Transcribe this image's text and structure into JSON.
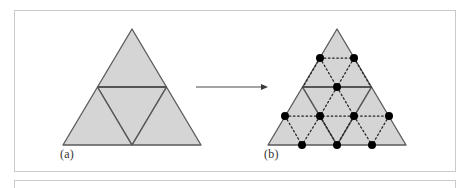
{
  "figure": {
    "captions": {
      "a": "(a)",
      "b": "(b)"
    },
    "arrow": {
      "name": "transform-arrow",
      "x1": 196,
      "y1": 87,
      "x2": 268,
      "y2": 87,
      "color": "#4a4a4a"
    },
    "colors": {
      "triangle_fill": "#d5d5d5",
      "triangle_stroke": "#5a5a5a",
      "dotted_stroke": "#2a2a2a",
      "dot_fill": "#000000",
      "panel_border": "#c9cbcd",
      "background": "#ffffff",
      "caption_text": "#333333"
    },
    "panel_a": {
      "name": "triangle-panel-a",
      "outer_triangle": [
        [
          132,
          29
        ],
        [
          63,
          145
        ],
        [
          201,
          145
        ]
      ],
      "midpoints": [
        [
          97.5,
          87
        ],
        [
          166.5,
          87
        ],
        [
          132,
          145
        ]
      ],
      "inner_triangle": [
        [
          97.5,
          87
        ],
        [
          166.5,
          87
        ],
        [
          132,
          145
        ]
      ],
      "sub_triangle_count": 4
    },
    "panel_b": {
      "name": "triangle-panel-b",
      "outer_triangle": [
        [
          337,
          29
        ],
        [
          268,
          145
        ],
        [
          406,
          145
        ]
      ],
      "midpoints": [
        [
          302.5,
          87
        ],
        [
          371.5,
          87
        ],
        [
          337,
          145
        ]
      ],
      "inner_triangle": [
        [
          302.5,
          87
        ],
        [
          371.5,
          87
        ],
        [
          337,
          145
        ]
      ],
      "dots": [
        {
          "x": 320,
          "y": 58
        },
        {
          "x": 354,
          "y": 58
        },
        {
          "x": 337,
          "y": 87
        },
        {
          "x": 285,
          "y": 116
        },
        {
          "x": 320,
          "y": 116
        },
        {
          "x": 354,
          "y": 116
        },
        {
          "x": 389,
          "y": 116
        },
        {
          "x": 302,
          "y": 145
        },
        {
          "x": 337,
          "y": 145
        },
        {
          "x": 372,
          "y": 145
        }
      ],
      "dot_count": 10,
      "dot_radius": 4,
      "dotted_edges": [
        [
          [
            320,
            58
          ],
          [
            354,
            58
          ]
        ],
        [
          [
            320,
            58
          ],
          [
            337,
            87
          ]
        ],
        [
          [
            354,
            58
          ],
          [
            337,
            87
          ]
        ],
        [
          [
            320,
            58
          ],
          [
            302,
            87
          ]
        ],
        [
          [
            354,
            58
          ],
          [
            372,
            87
          ]
        ],
        [
          [
            285,
            116
          ],
          [
            320,
            116
          ]
        ],
        [
          [
            320,
            116
          ],
          [
            354,
            116
          ]
        ],
        [
          [
            354,
            116
          ],
          [
            389,
            116
          ]
        ],
        [
          [
            337,
            87
          ],
          [
            320,
            116
          ]
        ],
        [
          [
            337,
            87
          ],
          [
            354,
            116
          ]
        ],
        [
          [
            320,
            58
          ],
          [
            303,
            87
          ]
        ],
        [
          [
            285,
            116
          ],
          [
            302,
            145
          ]
        ],
        [
          [
            320,
            116
          ],
          [
            302,
            145
          ]
        ],
        [
          [
            354,
            116
          ],
          [
            337,
            145
          ]
        ],
        [
          [
            320,
            116
          ],
          [
            337,
            145
          ]
        ],
        [
          [
            354,
            116
          ],
          [
            372,
            145
          ]
        ],
        [
          [
            389,
            116
          ],
          [
            372,
            145
          ]
        ]
      ]
    }
  }
}
